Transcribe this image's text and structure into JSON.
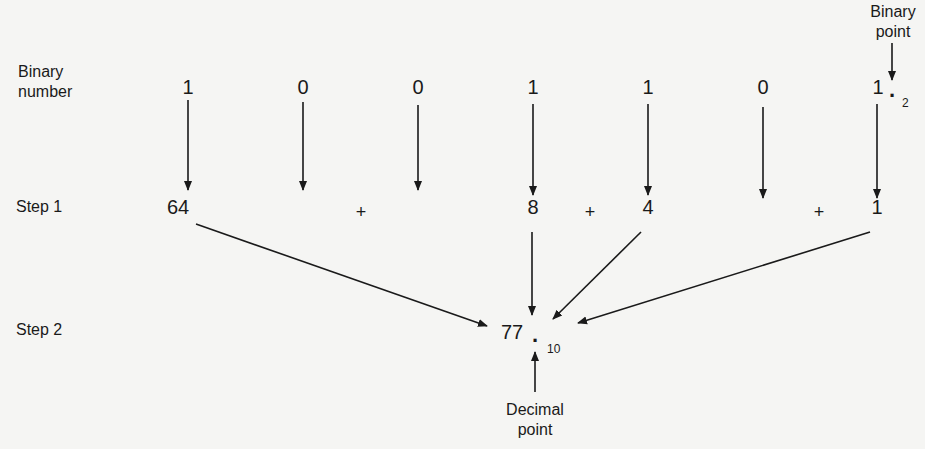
{
  "labels": {
    "binary_number": [
      "Binary",
      "number"
    ],
    "step1": "Step 1",
    "step2": "Step 2",
    "binary_point": [
      "Binary",
      "point"
    ],
    "decimal_point": [
      "Decimal",
      "point"
    ]
  },
  "binary_digits": [
    "1",
    "0",
    "0",
    "1",
    "1",
    "0",
    "1"
  ],
  "binary_point_symbol": ".",
  "binary_base": "2",
  "step1_terms": [
    {
      "value": "64",
      "column": 0
    },
    {
      "value": "+",
      "column": 2,
      "op": true
    },
    {
      "value": "8",
      "column": 3
    },
    {
      "value": "+",
      "column": 3.5,
      "op": true
    },
    {
      "value": "4",
      "column": 4
    },
    {
      "value": "+",
      "column": 5.5,
      "op": true
    },
    {
      "value": "1",
      "column": 6
    }
  ],
  "step1_values": {
    "v64": "64",
    "plus1": "+",
    "v8": "8",
    "plus2": "+",
    "v4": "4",
    "plus3": "+",
    "v1": "1"
  },
  "result": {
    "value": "77",
    "point": ".",
    "base": "10"
  },
  "colors": {
    "ink": "#1a1a1a",
    "background": "#f5f5f3"
  }
}
